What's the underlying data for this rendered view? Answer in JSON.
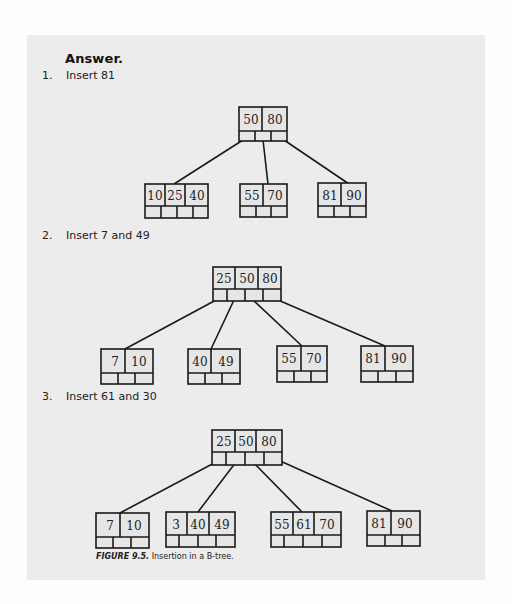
{
  "heading": "Answer.",
  "steps": [
    {
      "number": "1.",
      "label": "Insert 81",
      "tree": {
        "root": {
          "keys": [
            "50",
            "80"
          ]
        },
        "leaves": [
          {
            "keys": [
              "10",
              "25",
              "40"
            ]
          },
          {
            "keys": [
              "55",
              "70"
            ]
          },
          {
            "keys": [
              "81",
              "90"
            ]
          }
        ]
      }
    },
    {
      "number": "2.",
      "label": "Insert 7 and 49",
      "tree": {
        "root": {
          "keys": [
            "25",
            "50",
            "80"
          ]
        },
        "leaves": [
          {
            "keys": [
              "7",
              "10"
            ]
          },
          {
            "keys": [
              "40",
              "49"
            ]
          },
          {
            "keys": [
              "55",
              "70"
            ]
          },
          {
            "keys": [
              "81",
              "90"
            ]
          }
        ]
      }
    },
    {
      "number": "3.",
      "label": "Insert 61 and 30",
      "tree": {
        "root": {
          "keys": [
            "25",
            "50",
            "80"
          ]
        },
        "leaves": [
          {
            "keys": [
              "7",
              "10"
            ]
          },
          {
            "keys": [
              "3",
              "40",
              "49"
            ]
          },
          {
            "keys": [
              "55",
              "61",
              "70"
            ]
          },
          {
            "keys": [
              "81",
              "90"
            ]
          }
        ]
      }
    }
  ],
  "caption": {
    "figure_label": "FIGURE 9.5.",
    "text": " Insertion in a B-tree."
  },
  "colors": {
    "panel_background": "#ececec",
    "page_background": "#fdfdfd",
    "line_color": "#1a1a1a"
  }
}
